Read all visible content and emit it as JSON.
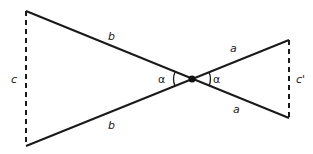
{
  "diagram": {
    "type": "two-triangles-vertical-angles",
    "points": {
      "top_left": [
        26,
        11
      ],
      "bottom_left": [
        26,
        146
      ],
      "center": [
        192,
        79
      ],
      "top_right": [
        289,
        40
      ],
      "bottom_right": [
        289,
        118
      ]
    },
    "labels": {
      "b_top": "b",
      "b_bottom": "b",
      "c": "c",
      "a_top": "a",
      "a_bottom": "a",
      "c_prime": "c'",
      "alpha_left": "α",
      "alpha_right": "α"
    },
    "colors": {
      "line": "#1a1a1a",
      "text": "#222222"
    }
  }
}
